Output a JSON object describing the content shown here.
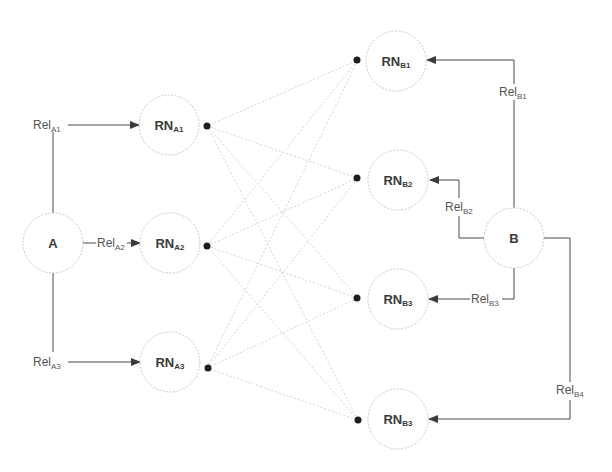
{
  "diagram": {
    "nodes": {
      "A": {
        "label": "A",
        "sub": ""
      },
      "B": {
        "label": "B",
        "sub": ""
      },
      "RNA1": {
        "label": "RN",
        "sub": "A1"
      },
      "RNA2": {
        "label": "RN",
        "sub": "A2"
      },
      "RNA3": {
        "label": "RN",
        "sub": "A3"
      },
      "RNB1": {
        "label": "RN",
        "sub": "B1"
      },
      "RNB2": {
        "label": "RN",
        "sub": "B2"
      },
      "RNB3": {
        "label": "RN",
        "sub": "B3"
      },
      "RNB4": {
        "label": "RN",
        "sub": "B3"
      }
    },
    "relations": {
      "RelA1": {
        "label": "Rel",
        "sub": "A1"
      },
      "RelA2": {
        "label": "Rel",
        "sub": "A2"
      },
      "RelA3": {
        "label": "Rel",
        "sub": "A3"
      },
      "RelB1": {
        "label": "Rel",
        "sub": "B1"
      },
      "RelB2": {
        "label": "Rel",
        "sub": "B2"
      },
      "RelB3": {
        "label": "Rel",
        "sub": "B3"
      },
      "RelB4": {
        "label": "Rel",
        "sub": "B4"
      }
    },
    "colors": {
      "connector": "#4a4a4a",
      "link": "#d4d4d4",
      "node_border": "#c8c8c8",
      "dot": "#1e1e1e"
    }
  }
}
